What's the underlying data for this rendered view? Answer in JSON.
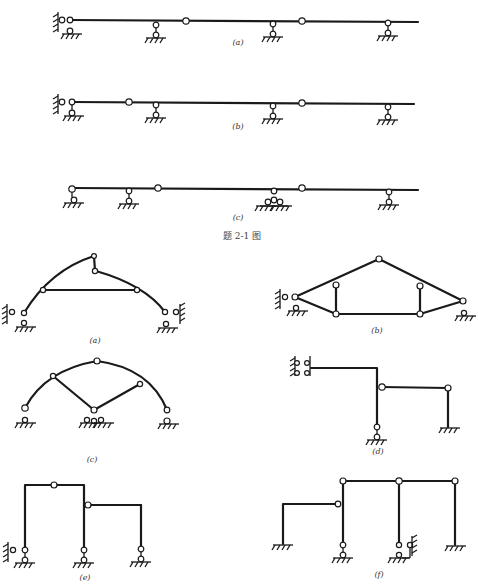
{
  "figure_2_1": {
    "caption": "题 2-1 图",
    "sub_labels": [
      "(a)",
      "(b)",
      "(c)"
    ]
  },
  "figure_2_2": {
    "sub_labels": [
      "(a)",
      "(b)",
      "(c)",
      "(d)",
      "(e)",
      "(f)"
    ]
  }
}
